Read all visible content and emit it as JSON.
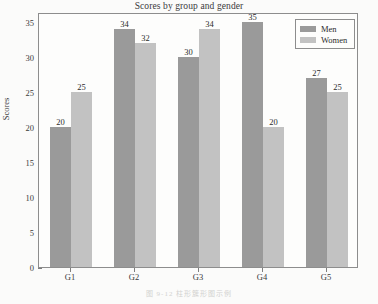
{
  "chart_data": {
    "type": "bar",
    "title": "Scores by group and gender",
    "xlabel": "",
    "ylabel": "Scores",
    "categories": [
      "G1",
      "G2",
      "G3",
      "G4",
      "G5"
    ],
    "series": [
      {
        "name": "Men",
        "color": "#9a9a9a",
        "values": [
          20,
          34,
          30,
          35,
          27
        ]
      },
      {
        "name": "Women",
        "color": "#c2c2c2",
        "values": [
          25,
          32,
          34,
          20,
          25
        ]
      }
    ],
    "ylim": [
      0,
      36.5
    ],
    "yticks": [
      0,
      5,
      10,
      15,
      20,
      25,
      30,
      35
    ],
    "ytick_labels": [
      "0",
      "5",
      "10",
      "15",
      "20",
      "25",
      "30",
      "35"
    ],
    "grid": false,
    "legend_position": "upper right",
    "data_labels": true
  },
  "caption": {
    "text": "图 9-12  柱形簇形图示例"
  }
}
